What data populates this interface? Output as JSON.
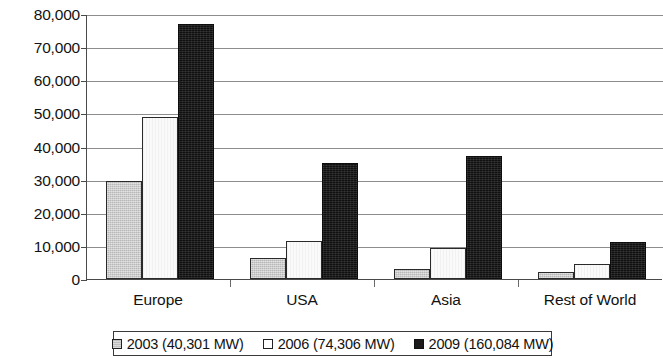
{
  "chart_data": {
    "type": "bar",
    "title": "",
    "subtitle": "",
    "xlabel": "",
    "ylabel": "",
    "categories": [
      "Europe",
      "USA",
      "Asia",
      "Rest of World"
    ],
    "series": [
      {
        "name": "2003 (40,301 MW)",
        "color": "#c9c9c9",
        "values": [
          29500,
          6300,
          3000,
          2200
        ]
      },
      {
        "name": "2006 (74,306 MW)",
        "color": "#fafafa",
        "values": [
          48800,
          11600,
          9500,
          4500
        ]
      },
      {
        "name": "2009 (160,084 MW)",
        "color": "#1b1b1b",
        "values": [
          77000,
          35000,
          37000,
          11200
        ]
      }
    ],
    "ylim": [
      0,
      80000
    ],
    "ytick_values": [
      0,
      10000,
      20000,
      30000,
      40000,
      50000,
      60000,
      70000,
      80000
    ],
    "ytick_labels": [
      "0",
      "10,000",
      "20,000",
      "30,000",
      "40,000",
      "50,000",
      "60,000",
      "70,000",
      "80,000"
    ],
    "grid": true,
    "grid_axis": "y",
    "legend_position": "bottom",
    "legend": [
      {
        "label": "2003 (40,301 MW)",
        "swatch": "gray"
      },
      {
        "label": "2006 (74,306 MW)",
        "swatch": "white"
      },
      {
        "label": "2009 (160,084 MW)",
        "swatch": "black"
      }
    ]
  }
}
